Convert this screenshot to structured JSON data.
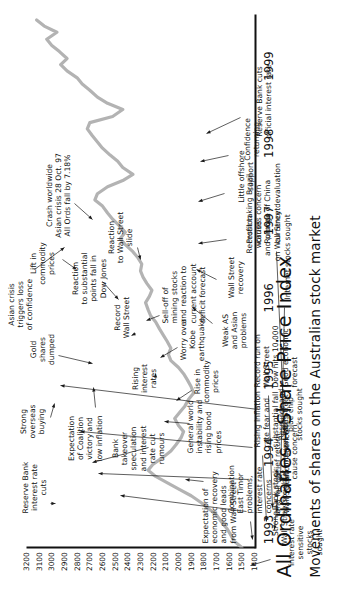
{
  "caption": "Movements of shares on the Australian stock market",
  "colors": {
    "series_line": "#b3b3b3",
    "axis": "#111111",
    "text": "#111111",
    "leader": "#1a1a1a"
  },
  "chart_data": {
    "type": "line",
    "title": "All Ordinaries – Share Price Index",
    "xlabel": "",
    "ylabel": "",
    "grid": false,
    "legend": null,
    "xlim": [
      1993,
      1999.9
    ],
    "ylim": [
      1400,
      3200
    ],
    "xtick_labels": [
      "1993",
      "1994",
      "1995",
      "1996",
      "1997",
      "1998",
      "1999"
    ],
    "ytick_labels": [
      "3200",
      "3100",
      "3000",
      "2900",
      "2800",
      "2700",
      "2600",
      "2500",
      "2400",
      "2300",
      "2200",
      "2100",
      "2000",
      "1900",
      "1800",
      "1700",
      "1600",
      "1500",
      "1400"
    ],
    "series": [
      {
        "name": "All Ordinaries Share Price Index",
        "x": [
          1993.0,
          1993.08,
          1993.17,
          1993.25,
          1993.33,
          1993.42,
          1993.5,
          1993.58,
          1993.67,
          1993.75,
          1993.83,
          1993.92,
          1994.0,
          1994.08,
          1994.17,
          1994.25,
          1994.33,
          1994.42,
          1994.5,
          1994.58,
          1994.67,
          1994.75,
          1994.83,
          1994.92,
          1995.0,
          1995.08,
          1995.17,
          1995.25,
          1995.33,
          1995.42,
          1995.5,
          1995.58,
          1995.67,
          1995.75,
          1995.83,
          1995.92,
          1996.0,
          1996.08,
          1996.17,
          1996.25,
          1996.33,
          1996.42,
          1996.5,
          1996.58,
          1996.67,
          1996.75,
          1996.83,
          1996.92,
          1997.0,
          1997.08,
          1997.17,
          1997.25,
          1997.33,
          1997.42,
          1997.5,
          1997.58,
          1997.67,
          1997.75,
          1997.83,
          1997.92,
          1998.0,
          1998.08,
          1998.17,
          1998.25,
          1998.33,
          1998.42,
          1998.5,
          1998.58,
          1998.67,
          1998.75,
          1998.83,
          1998.92,
          1999.0,
          1999.08,
          1999.17,
          1999.25,
          1999.33,
          1999.42,
          1999.5,
          1999.58,
          1999.67,
          1999.75,
          1999.83
        ],
        "values": [
          1500,
          1560,
          1590,
          1620,
          1660,
          1700,
          1760,
          1820,
          1900,
          1990,
          2080,
          2180,
          2240,
          2200,
          2120,
          2060,
          2020,
          1980,
          1960,
          2000,
          2030,
          1990,
          1950,
          1920,
          1880,
          1900,
          1930,
          1960,
          2000,
          2060,
          2080,
          2060,
          2090,
          2120,
          2150,
          2180,
          2220,
          2240,
          2260,
          2230,
          2210,
          2250,
          2280,
          2300,
          2290,
          2320,
          2360,
          2420,
          2460,
          2420,
          2470,
          2520,
          2560,
          2600,
          2660,
          2640,
          2560,
          2440,
          2360,
          2440,
          2480,
          2540,
          2600,
          2640,
          2680,
          2720,
          2700,
          2520,
          2440,
          2560,
          2640,
          2700,
          2760,
          2800,
          2880,
          2930,
          2880,
          2940,
          3000,
          3040,
          2960,
          3060,
          3120
        ]
      }
    ]
  },
  "annotations": [
    {
      "id": "expectation-economic-recovery",
      "text": "Expectation of\neconomic recovery\nand good leads\nfrom Wall Street"
    },
    {
      "id": "bank-takeover-speculation",
      "text": "Bank\ntakeover\nspeculation\nand interest\nrate cut\nrumours"
    },
    {
      "id": "general-world-instability",
      "text": "General world\ninstability and\nrising bond\nprices"
    },
    {
      "id": "expectation-coalition-victory",
      "text": "Expectation\nof Coalition\nvictory and\nlow inflation"
    },
    {
      "id": "rise-in-commodity-prices",
      "text": "Rise in\ncommodity\nprices"
    },
    {
      "id": "rising-interest-rates",
      "text": "Rising\ninterest\nrates"
    },
    {
      "id": "worry-over-kobe-earthquake",
      "text": "Worry over\nKobe\nearthquake"
    },
    {
      "id": "record-wall-street",
      "text": "Record\nWall Street"
    },
    {
      "id": "sell-off-of-mining-stocks",
      "text": "Sell-off of\nmining stocks\nand reaction to\ncurrent account\ndeficit forecast"
    },
    {
      "id": "strong-overseas-buying",
      "text": "Strong\noverseas\nbuying"
    },
    {
      "id": "reserve-bank-interest-rate-cuts",
      "text": "Reserve Bank\ninterest rate\ncuts"
    },
    {
      "id": "gold-shares-dumped",
      "text": "Gold\nshares\ndumped"
    },
    {
      "id": "reaction-to-substantial-points-fall",
      "text": "Reaction\nto substantial\npoints fall in\nDow Jones"
    },
    {
      "id": "lift-in-commodity-prices",
      "text": "Lift in\ncommodity\nprices"
    },
    {
      "id": "reaction-to-wall-street-slide",
      "text": "Reaction\nto Wall Street\nslide"
    },
    {
      "id": "crash-worldwide",
      "text": "Crash worldwide\nAsian crisis 28 Oct. 97\nAll Ords fall by 7.18%"
    },
    {
      "id": "asian-crisis-triggers-loss",
      "text": "Asian crisis\ntriggers loss\nof confidence"
    },
    {
      "id": "strong-wall-street",
      "text": "Strong\nWall Street"
    },
    {
      "id": "bank-stock-sought",
      "text": "Bank stock\nsought"
    },
    {
      "id": "brief-return-of-confidence",
      "text": "Brief return\nof confidence"
    },
    {
      "id": "resource-and-blue-chip",
      "text": "Resource and\nblue chip\nstocks sought"
    },
    {
      "id": "weak-as-and-asian-problems",
      "text": "Weak AS\nand Asian\nproblems"
    },
    {
      "id": "wall-street-recovery",
      "text": "Wall Street\nrecovery"
    },
    {
      "id": "recession-worries",
      "text": "Recession\nworries\nand plunge\non Wall Street"
    },
    {
      "id": "little-offshore-support",
      "text": "Little offshore\nsupport"
    },
    {
      "id": "confidence-returning",
      "text": "Confidence\nreturning"
    },
    {
      "id": "reserve-bank-cuts-official",
      "text": "Reserve Bank cuts\nofficial interest rate"
    },
    {
      "id": "interest-rate-sensitive-stocks",
      "text": "interest rate\nsensitive\nstocks\nsought"
    },
    {
      "id": "combination-east-timor",
      "text": "Combination\nEast Timor\nproblems,\ninterest rate\nconcerns\nand fall on\nWall Street"
    },
    {
      "id": "us-interest-rates-cause-concern",
      "text": "US interest rates\ncause concern"
    },
    {
      "id": "rising-inflation-rate-fear",
      "text": "Rising inflation\nrate fear and\nsubstantial fall\non Wall Street"
    },
    {
      "id": "record-run-on-wall-street",
      "text": "Record run on\nWall Street\nDow hits 10 000\nGood economic\nforecast"
    },
    {
      "id": "internet-stocks-sought",
      "text": "Internet stocks sought"
    },
    {
      "id": "profit-taking-brazil",
      "text": "Profit taking Brazil\ncauses concern\nRumour of China\ncurrency devaluation"
    }
  ]
}
